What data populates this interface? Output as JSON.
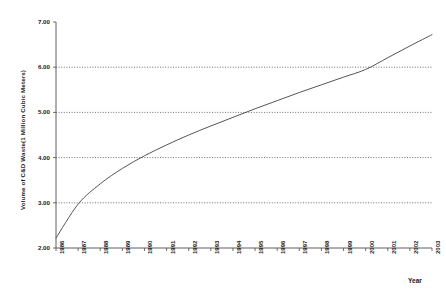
{
  "chart_data": {
    "type": "line",
    "title": "",
    "xlabel": "Year",
    "ylabel": "Volume of C&D Waste(1 Million Cubic Meters)",
    "xlim": [
      1986,
      2003
    ],
    "ylim": [
      2.0,
      7.0
    ],
    "grid": true,
    "legend": "none",
    "x_tick_labels": [
      "1986",
      "1987",
      "1988",
      "1989",
      "1990",
      "1991",
      "1992",
      "1993",
      "1994",
      "1995",
      "1996",
      "1997",
      "1998",
      "1999",
      "2000",
      "2001",
      "2002",
      "2003"
    ],
    "y_tick_labels": [
      "2.00",
      "3.00",
      "4.00",
      "5.00",
      "6.00",
      "7.00"
    ],
    "y_tick_values": [
      2.0,
      3.0,
      4.0,
      5.0,
      6.0,
      7.0
    ],
    "gridline_values": [
      3.0,
      4.0,
      5.0,
      6.0
    ],
    "series": [
      {
        "name": "Volume of C&D Waste",
        "x": [
          1986,
          1987,
          1988,
          1989,
          1990,
          1991,
          1992,
          1993,
          1994,
          1995,
          1996,
          1997,
          1998,
          1999,
          2000,
          2001,
          2002,
          2003
        ],
        "values": [
          2.22,
          2.97,
          3.42,
          3.76,
          4.04,
          4.28,
          4.5,
          4.7,
          4.89,
          5.08,
          5.26,
          5.44,
          5.61,
          5.78,
          5.95,
          6.21,
          6.47,
          6.72
        ]
      }
    ],
    "annotations": []
  },
  "axis": {
    "y_title": "Volume of C&D Waste(1 Million Cubic Meters)",
    "x_title": "Year"
  }
}
